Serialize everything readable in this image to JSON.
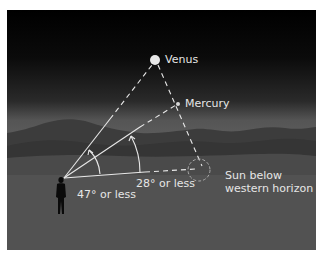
{
  "diagram": {
    "labels": {
      "venus": "Venus",
      "mercury": "Mercury",
      "angle_venus": "47° or less",
      "angle_mercury": "28° or less",
      "sun_line1": "Sun below",
      "sun_line2": "western horizon"
    },
    "colors": {
      "sky_top": "#000000",
      "sky_horizon": "#5e5e5e",
      "mountain_far": "#3c3c3c",
      "mountain_near": "#333333",
      "lines": "#e8e8e8",
      "sun_outline": "#aaaaaa",
      "observer": "#0a0a0a"
    },
    "geometry": {
      "observer": [
        63,
        178
      ],
      "venus": [
        155,
        60
      ],
      "mercury": [
        178,
        104
      ],
      "sun": [
        200,
        171
      ],
      "max_elongation_venus_deg": 47,
      "max_elongation_mercury_deg": 28
    }
  }
}
